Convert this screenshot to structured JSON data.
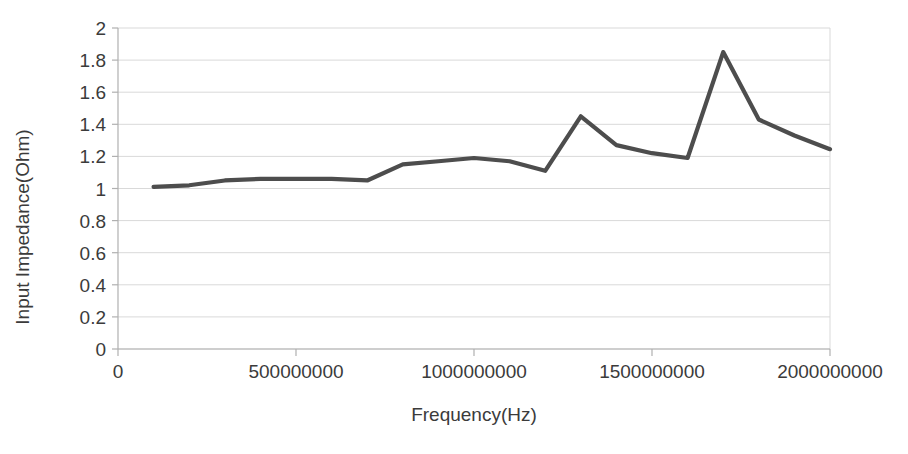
{
  "chart_data": {
    "type": "line",
    "title": "",
    "xlabel": "Frequency(Hz)",
    "ylabel": "Input Impedance(Ohm)",
    "xlim": [
      0,
      2000000000
    ],
    "ylim": [
      0,
      2
    ],
    "grid": true,
    "legend": null,
    "x_ticks": [
      "0",
      "500000000",
      "1000000000",
      "1500000000",
      "2000000000"
    ],
    "x_tick_values": [
      0,
      500000000,
      1000000000,
      1500000000,
      2000000000
    ],
    "y_ticks": [
      "0",
      "0.2",
      "0.4",
      "0.6",
      "0.8",
      "1",
      "1.2",
      "1.4",
      "1.6",
      "1.8",
      "2"
    ],
    "y_tick_values": [
      0,
      0.2,
      0.4,
      0.6,
      0.8,
      1,
      1.2,
      1.4,
      1.6,
      1.8,
      2
    ],
    "series": [
      {
        "name": "Input Impedance",
        "color": "#4d4d4d",
        "x": [
          100000000,
          200000000,
          300000000,
          400000000,
          500000000,
          600000000,
          700000000,
          800000000,
          900000000,
          1000000000,
          1100000000,
          1200000000,
          1300000000,
          1400000000,
          1500000000,
          1600000000,
          1700000000,
          1800000000,
          1900000000,
          2000000000
        ],
        "values": [
          1.01,
          1.02,
          1.05,
          1.06,
          1.06,
          1.06,
          1.05,
          1.15,
          1.17,
          1.19,
          1.17,
          1.11,
          1.45,
          1.27,
          1.22,
          1.19,
          1.85,
          1.43,
          1.33,
          1.245
        ]
      }
    ]
  },
  "axes": {
    "y_title": "Input Impedance(Ohm)",
    "x_title": "Frequency(Hz)"
  },
  "colors": {
    "line": "#4d4d4d",
    "grid": "#d9d9d9",
    "axis": "#b0b0b0",
    "text": "#3b3b3b"
  }
}
